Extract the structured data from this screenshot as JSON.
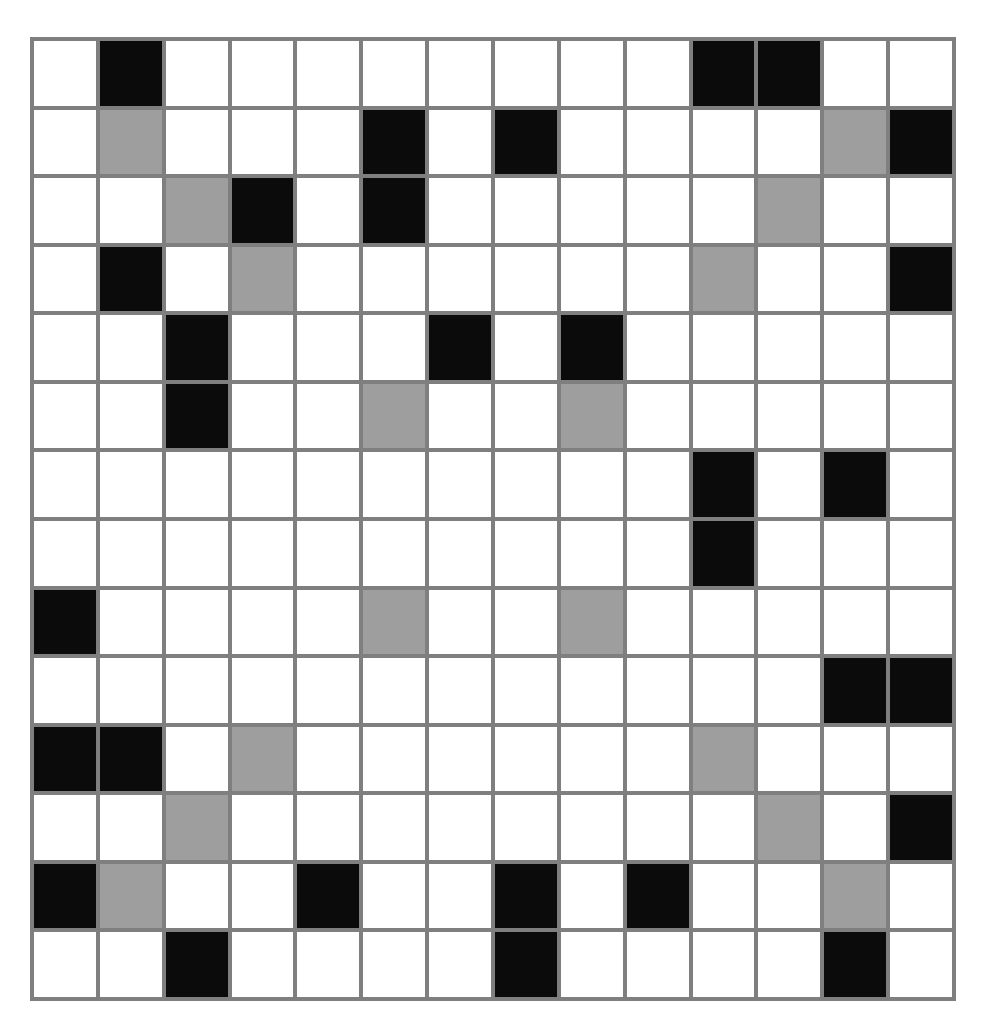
{
  "grid": {
    "rows": 14,
    "cols": 14,
    "legend": {
      "0": "white",
      "1": "black",
      "2": "gray"
    },
    "colors": {
      "white": "#ffffff",
      "black": "#0b0b0b",
      "gray": "#9e9e9e",
      "grid_line": "#7f7f7f"
    },
    "cells": [
      [
        0,
        1,
        0,
        0,
        0,
        0,
        0,
        0,
        0,
        0,
        1,
        1,
        0,
        0
      ],
      [
        0,
        2,
        0,
        0,
        0,
        1,
        0,
        1,
        0,
        0,
        0,
        0,
        2,
        1
      ],
      [
        0,
        0,
        2,
        1,
        0,
        1,
        0,
        0,
        0,
        0,
        0,
        2,
        0,
        0
      ],
      [
        0,
        1,
        0,
        2,
        0,
        0,
        0,
        0,
        0,
        0,
        2,
        0,
        0,
        1
      ],
      [
        0,
        0,
        1,
        0,
        0,
        0,
        1,
        0,
        1,
        0,
        0,
        0,
        0,
        0
      ],
      [
        0,
        0,
        1,
        0,
        0,
        2,
        0,
        0,
        2,
        0,
        0,
        0,
        0,
        0
      ],
      [
        0,
        0,
        0,
        0,
        0,
        0,
        0,
        0,
        0,
        0,
        1,
        0,
        1,
        0
      ],
      [
        0,
        0,
        0,
        0,
        0,
        0,
        0,
        0,
        0,
        0,
        1,
        0,
        0,
        0
      ],
      [
        1,
        0,
        0,
        0,
        0,
        2,
        0,
        0,
        2,
        0,
        0,
        0,
        0,
        0
      ],
      [
        0,
        0,
        0,
        0,
        0,
        0,
        0,
        0,
        0,
        0,
        0,
        0,
        1,
        1
      ],
      [
        1,
        1,
        0,
        2,
        0,
        0,
        0,
        0,
        0,
        0,
        2,
        0,
        0,
        0
      ],
      [
        0,
        0,
        2,
        0,
        0,
        0,
        0,
        0,
        0,
        0,
        0,
        2,
        0,
        1
      ],
      [
        1,
        2,
        0,
        0,
        1,
        0,
        0,
        1,
        0,
        1,
        0,
        0,
        2,
        0
      ],
      [
        0,
        0,
        1,
        0,
        0,
        0,
        0,
        1,
        0,
        0,
        0,
        0,
        1,
        0
      ]
    ]
  }
}
